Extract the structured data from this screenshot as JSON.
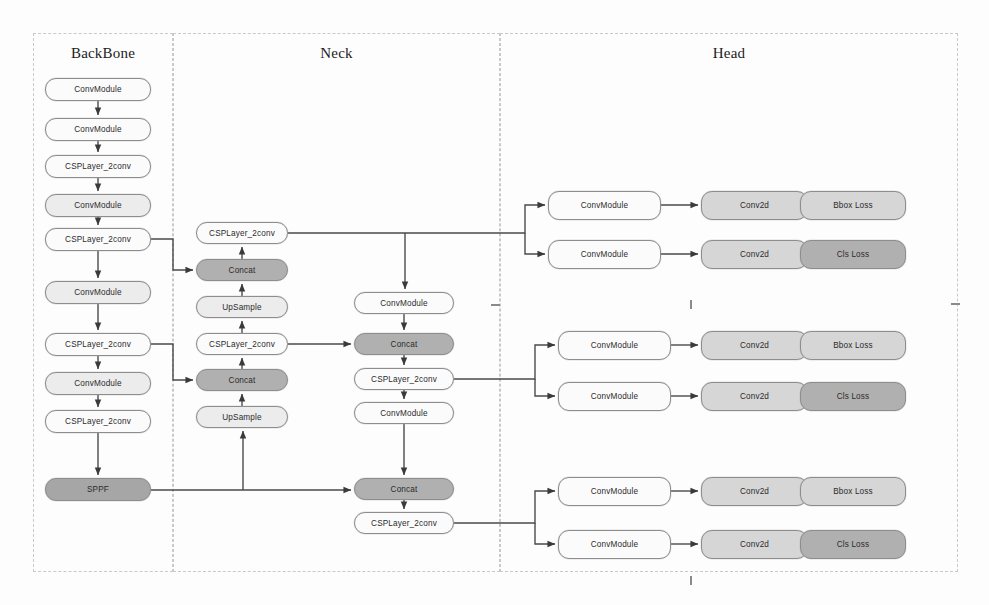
{
  "diagram": {
    "panels": [
      {
        "id": "backbone",
        "label": "BackBone",
        "x": 33,
        "y": 33,
        "w": 140,
        "h": 539
      },
      {
        "id": "neck",
        "label": "Neck",
        "x": 173,
        "y": 33,
        "w": 327,
        "h": 539
      },
      {
        "id": "head",
        "label": "Head",
        "x": 500,
        "y": 33,
        "w": 458,
        "h": 539
      }
    ],
    "panel_title_y": 55,
    "colors": {
      "node_white": "#fbfbfb",
      "node_light": "#ececec",
      "node_mid": "#d6d6d6",
      "node_dark": "#b0b0b0",
      "node_darker": "#a6a6a6",
      "border": "#8d8d8d",
      "edge": "#4a4a4a",
      "panel_border": "#c9c9c9",
      "text": "#2b2b2b",
      "background": "#fdfdfd"
    },
    "nodes": [
      {
        "id": "bb1",
        "label": "ConvModule",
        "x": 45,
        "y": 78,
        "w": 106,
        "h": 23,
        "tone": "tone-white",
        "group": "backbone"
      },
      {
        "id": "bb2",
        "label": "ConvModule",
        "x": 45,
        "y": 118,
        "w": 106,
        "h": 23,
        "tone": "tone-white",
        "group": "backbone"
      },
      {
        "id": "bb3",
        "label": "CSPLayer_2conv",
        "x": 45,
        "y": 155,
        "w": 106,
        "h": 23,
        "tone": "tone-white",
        "group": "backbone"
      },
      {
        "id": "bb4",
        "label": "ConvModule",
        "x": 45,
        "y": 194,
        "w": 106,
        "h": 23,
        "tone": "tone-light",
        "group": "backbone"
      },
      {
        "id": "bb5",
        "label": "CSPLayer_2conv",
        "x": 45,
        "y": 228,
        "w": 106,
        "h": 23,
        "tone": "tone-white",
        "group": "backbone"
      },
      {
        "id": "bb6",
        "label": "ConvModule",
        "x": 45,
        "y": 281,
        "w": 106,
        "h": 23,
        "tone": "tone-light",
        "group": "backbone"
      },
      {
        "id": "bb7",
        "label": "CSPLayer_2conv",
        "x": 45,
        "y": 333,
        "w": 106,
        "h": 23,
        "tone": "tone-white",
        "group": "backbone"
      },
      {
        "id": "bb8",
        "label": "ConvModule",
        "x": 45,
        "y": 372,
        "w": 106,
        "h": 23,
        "tone": "tone-light",
        "group": "backbone"
      },
      {
        "id": "bb9",
        "label": "CSPLayer_2conv",
        "x": 45,
        "y": 410,
        "w": 106,
        "h": 23,
        "tone": "tone-white",
        "group": "backbone"
      },
      {
        "id": "bb10",
        "label": "SPPF",
        "x": 45,
        "y": 478,
        "w": 106,
        "h": 23,
        "tone": "tone-darker",
        "group": "backbone"
      },
      {
        "id": "nk1",
        "label": "CSPLayer_2conv",
        "x": 196,
        "y": 222,
        "w": 92,
        "h": 22,
        "tone": "tone-white",
        "group": "neck-left"
      },
      {
        "id": "nk2",
        "label": "Concat",
        "x": 196,
        "y": 259,
        "w": 92,
        "h": 22,
        "tone": "tone-dark",
        "group": "neck-left"
      },
      {
        "id": "nk3",
        "label": "UpSample",
        "x": 196,
        "y": 296,
        "w": 92,
        "h": 22,
        "tone": "tone-light",
        "group": "neck-left"
      },
      {
        "id": "nk4",
        "label": "CSPLayer_2conv",
        "x": 196,
        "y": 333,
        "w": 92,
        "h": 22,
        "tone": "tone-white",
        "group": "neck-left"
      },
      {
        "id": "nk5",
        "label": "Concat",
        "x": 196,
        "y": 369,
        "w": 92,
        "h": 22,
        "tone": "tone-dark",
        "group": "neck-left"
      },
      {
        "id": "nk6",
        "label": "UpSample",
        "x": 196,
        "y": 406,
        "w": 92,
        "h": 22,
        "tone": "tone-light",
        "group": "neck-left"
      },
      {
        "id": "nm1",
        "label": "ConvModule",
        "x": 354,
        "y": 292,
        "w": 100,
        "h": 22,
        "tone": "tone-white",
        "group": "neck-mid"
      },
      {
        "id": "nm2",
        "label": "Concat",
        "x": 354,
        "y": 333,
        "w": 100,
        "h": 22,
        "tone": "tone-dark",
        "group": "neck-mid"
      },
      {
        "id": "nm3",
        "label": "CSPLayer_2conv",
        "x": 354,
        "y": 368,
        "w": 100,
        "h": 22,
        "tone": "tone-white",
        "group": "neck-mid"
      },
      {
        "id": "nm4",
        "label": "ConvModule",
        "x": 354,
        "y": 402,
        "w": 100,
        "h": 22,
        "tone": "tone-white",
        "group": "neck-mid"
      },
      {
        "id": "nm5",
        "label": "Concat",
        "x": 354,
        "y": 478,
        "w": 100,
        "h": 22,
        "tone": "tone-dark",
        "group": "neck-mid"
      },
      {
        "id": "nm6",
        "label": "CSPLayer_2conv",
        "x": 354,
        "y": 512,
        "w": 100,
        "h": 22,
        "tone": "tone-white",
        "group": "neck-mid"
      },
      {
        "id": "h1a",
        "label": "ConvModule",
        "x": 548,
        "y": 191,
        "w": 113,
        "h": 29,
        "tone": "tone-white",
        "group": "head-1"
      },
      {
        "id": "h1b",
        "label": "Conv2d",
        "x": 701,
        "y": 191,
        "w": 107,
        "h": 29,
        "tone": "tone-mid",
        "group": "head-1"
      },
      {
        "id": "h1c",
        "label": "Bbox Loss",
        "x": 800,
        "y": 191,
        "w": 106,
        "h": 29,
        "tone": "tone-mid",
        "group": "head-1"
      },
      {
        "id": "h1d",
        "label": "ConvModule",
        "x": 548,
        "y": 240,
        "w": 113,
        "h": 29,
        "tone": "tone-white",
        "group": "head-1"
      },
      {
        "id": "h1e",
        "label": "Conv2d",
        "x": 701,
        "y": 240,
        "w": 107,
        "h": 29,
        "tone": "tone-mid",
        "group": "head-1"
      },
      {
        "id": "h1f",
        "label": "Cls Loss",
        "x": 800,
        "y": 240,
        "w": 106,
        "h": 29,
        "tone": "tone-dark",
        "group": "head-1"
      },
      {
        "id": "h2a",
        "label": "ConvModule",
        "x": 558,
        "y": 331,
        "w": 113,
        "h": 29,
        "tone": "tone-white",
        "group": "head-2"
      },
      {
        "id": "h2b",
        "label": "Conv2d",
        "x": 701,
        "y": 331,
        "w": 107,
        "h": 29,
        "tone": "tone-mid",
        "group": "head-2"
      },
      {
        "id": "h2c",
        "label": "Bbox Loss",
        "x": 800,
        "y": 331,
        "w": 106,
        "h": 29,
        "tone": "tone-mid",
        "group": "head-2"
      },
      {
        "id": "h2d",
        "label": "ConvModule",
        "x": 558,
        "y": 382,
        "w": 113,
        "h": 29,
        "tone": "tone-white",
        "group": "head-2"
      },
      {
        "id": "h2e",
        "label": "Conv2d",
        "x": 701,
        "y": 382,
        "w": 107,
        "h": 29,
        "tone": "tone-mid",
        "group": "head-2"
      },
      {
        "id": "h2f",
        "label": "Cls Loss",
        "x": 800,
        "y": 382,
        "w": 106,
        "h": 29,
        "tone": "tone-dark",
        "group": "head-2"
      },
      {
        "id": "h3a",
        "label": "ConvModule",
        "x": 558,
        "y": 477,
        "w": 113,
        "h": 29,
        "tone": "tone-white",
        "group": "head-3"
      },
      {
        "id": "h3b",
        "label": "Conv2d",
        "x": 701,
        "y": 477,
        "w": 107,
        "h": 29,
        "tone": "tone-mid",
        "group": "head-3"
      },
      {
        "id": "h3c",
        "label": "Bbox Loss",
        "x": 800,
        "y": 477,
        "w": 106,
        "h": 29,
        "tone": "tone-mid",
        "group": "head-3"
      },
      {
        "id": "h3d",
        "label": "ConvModule",
        "x": 558,
        "y": 530,
        "w": 113,
        "h": 29,
        "tone": "tone-white",
        "group": "head-3"
      },
      {
        "id": "h3e",
        "label": "Conv2d",
        "x": 701,
        "y": 530,
        "w": 107,
        "h": 29,
        "tone": "tone-mid",
        "group": "head-3"
      },
      {
        "id": "h3f",
        "label": "Cls Loss",
        "x": 800,
        "y": 530,
        "w": 106,
        "h": 29,
        "tone": "tone-dark",
        "group": "head-3"
      }
    ],
    "edges": [
      {
        "from": "bb1",
        "to": "bb2",
        "path": "M 98 101 L 98 115"
      },
      {
        "from": "bb2",
        "to": "bb3",
        "path": "M 98 141 L 98 152"
      },
      {
        "from": "bb3",
        "to": "bb4",
        "path": "M 98 178 L 98 191"
      },
      {
        "from": "bb4",
        "to": "bb5",
        "path": "M 98 217 L 98 225"
      },
      {
        "from": "bb5",
        "to": "bb6",
        "path": "M 98 251 L 98 278"
      },
      {
        "from": "bb6",
        "to": "bb7",
        "path": "M 98 304 L 98 330"
      },
      {
        "from": "bb7",
        "to": "bb8",
        "path": "M 98 356 L 98 369"
      },
      {
        "from": "bb8",
        "to": "bb9",
        "path": "M 98 395 L 98 407"
      },
      {
        "from": "bb9",
        "to": "bb10",
        "path": "M 98 433 L 98 475"
      },
      {
        "from": "bb5",
        "to": "nk2",
        "path": "M 151 239 L 173 239 L 173 270 L 193 270"
      },
      {
        "from": "bb7",
        "to": "nk5",
        "path": "M 151 344 L 173 344 L 173 380 L 193 380"
      },
      {
        "from": "bb10",
        "to": "nm5",
        "path": "M 151 490 L 351 490"
      },
      {
        "from": "bb10",
        "to": "nk6",
        "path": "M 243 490 L 243 431"
      },
      {
        "from": "nk6",
        "to": "nk5",
        "path": "M 242 406 L 242 394"
      },
      {
        "from": "nk5",
        "to": "nk4",
        "path": "M 242 369 L 242 358"
      },
      {
        "from": "nk4",
        "to": "nk3",
        "path": "M 242 333 L 242 321"
      },
      {
        "from": "nk3",
        "to": "nk2",
        "path": "M 242 296 L 242 284"
      },
      {
        "from": "nk2",
        "to": "nk1",
        "path": "M 242 259 L 242 247"
      },
      {
        "from": "nk1",
        "to": "head1",
        "path": "M 288 233 L 525 233 L 525 205 L 545 205"
      },
      {
        "from": "nk1",
        "to": "head1b",
        "path": "M 525 233 L 525 254 L 545 254"
      },
      {
        "from": "nk1",
        "to": "nm1",
        "path": "M 405 233 L 405 289"
      },
      {
        "from": "nk4",
        "to": "nm2",
        "path": "M 288 344 L 351 344"
      },
      {
        "from": "nm1",
        "to": "nm2",
        "path": "M 404 314 L 404 330"
      },
      {
        "from": "nm2",
        "to": "nm3",
        "path": "M 404 355 L 404 365"
      },
      {
        "from": "nm3",
        "to": "nm4",
        "path": "M 404 390 L 404 399"
      },
      {
        "from": "nm4",
        "to": "nm5",
        "path": "M 404 424 L 404 475"
      },
      {
        "from": "nm3",
        "to": "head2",
        "path": "M 454 379 L 535 379 L 535 345 L 555 345"
      },
      {
        "from": "nm3",
        "to": "head2b",
        "path": "M 535 379 L 535 396 L 555 396"
      },
      {
        "from": "nm5",
        "to": "nm6",
        "path": "M 404 500 L 404 509"
      },
      {
        "from": "nm6",
        "to": "head3",
        "path": "M 454 523 L 535 523 L 535 491 L 555 491"
      },
      {
        "from": "nm6",
        "to": "head3b",
        "path": "M 535 523 L 535 544 L 555 544"
      },
      {
        "from": "h1a",
        "to": "h1b",
        "path": "M 661 205 L 698 205"
      },
      {
        "from": "h1b",
        "to": "h1c",
        "path": "M 764 205 L 797 205"
      },
      {
        "from": "h1d",
        "to": "h1e",
        "path": "M 661 254 L 698 254"
      },
      {
        "from": "h1e",
        "to": "h1f",
        "path": "M 764 254 L 797 254"
      },
      {
        "from": "h2a",
        "to": "h2b",
        "path": "M 671 345 L 698 345"
      },
      {
        "from": "h2b",
        "to": "h2c",
        "path": "M 764 345 L 797 345"
      },
      {
        "from": "h2d",
        "to": "h2e",
        "path": "M 671 396 L 698 396"
      },
      {
        "from": "h2e",
        "to": "h2f",
        "path": "M 764 396 L 797 396"
      },
      {
        "from": "h3a",
        "to": "h3b",
        "path": "M 671 491 L 698 491"
      },
      {
        "from": "h3b",
        "to": "h3c",
        "path": "M 764 491 L 797 491"
      },
      {
        "from": "h3d",
        "to": "h3e",
        "path": "M 671 544 L 698 544"
      },
      {
        "from": "h3e",
        "to": "h3f",
        "path": "M 764 544 L 797 544"
      }
    ],
    "scan_marks": [
      {
        "x": 491,
        "y": 304,
        "w": 9,
        "h": 2
      },
      {
        "x": 690,
        "y": 300,
        "w": 2,
        "h": 9
      },
      {
        "x": 951,
        "y": 303,
        "w": 9,
        "h": 2
      },
      {
        "x": 690,
        "y": 576,
        "w": 2,
        "h": 9
      }
    ]
  }
}
